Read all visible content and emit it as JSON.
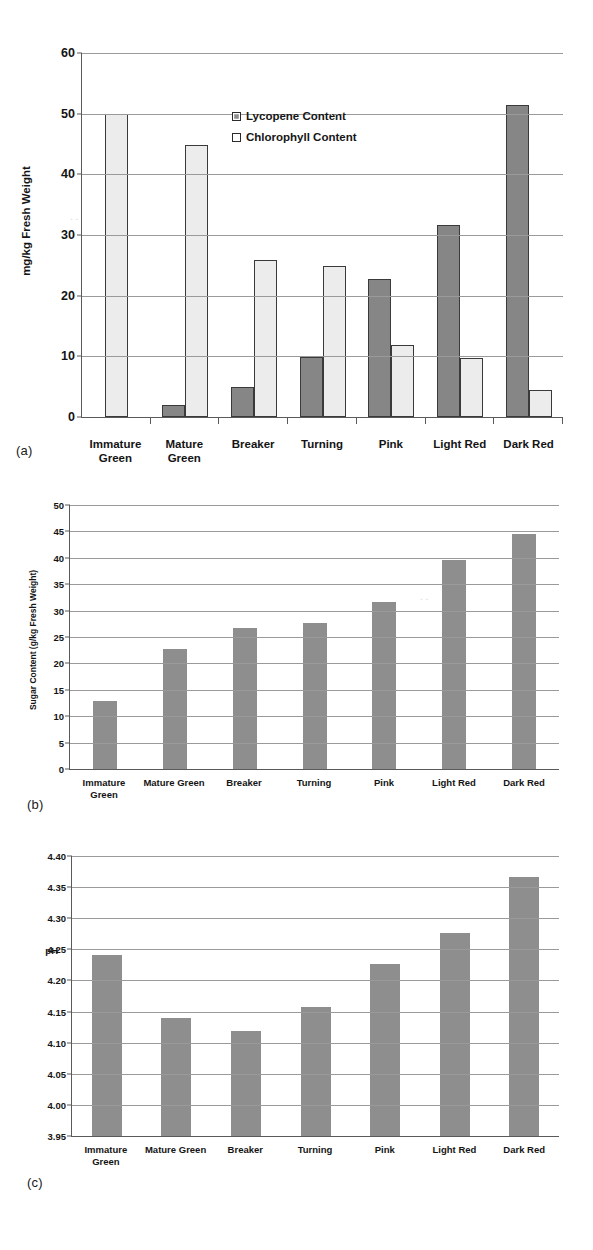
{
  "figure": {
    "panels": [
      {
        "tag": "(a)",
        "ylabel": "mg/kg Fresh Weight",
        "yticks": [
          "0",
          "10",
          "20",
          "30",
          "40",
          "50",
          "60"
        ]
      },
      {
        "tag": "(b)",
        "ylabel": "Sugar Content (g/kg Fresh Weight)",
        "yticks": [
          "0",
          "5",
          "10",
          "15",
          "20",
          "25",
          "30",
          "35",
          "40",
          "45",
          "50"
        ]
      },
      {
        "tag": "(c)",
        "ylabel": "pH",
        "yticks": [
          "3.95",
          "4.00",
          "4.05",
          "4.10",
          "4.15",
          "4.20",
          "4.25",
          "4.30",
          "4.35",
          "4.40"
        ]
      }
    ],
    "categories_a": [
      [
        "Immature",
        "Green"
      ],
      [
        "Mature",
        "Green"
      ],
      [
        "Breaker",
        ""
      ],
      [
        "Turning",
        ""
      ],
      [
        "Pink",
        ""
      ],
      [
        "Light Red",
        ""
      ],
      [
        "Dark Red",
        ""
      ]
    ],
    "categories_bc": [
      [
        "Immature",
        "Green"
      ],
      [
        "Mature Green",
        ""
      ],
      [
        "Breaker",
        ""
      ],
      [
        "Turning",
        ""
      ],
      [
        "Pink",
        ""
      ],
      [
        "Light Red",
        ""
      ],
      [
        "Dark Red",
        ""
      ]
    ],
    "legend": {
      "lycopene_label": "Lycopene Content",
      "chlorophyll_label": "Chlorophyll Content"
    },
    "colors": {
      "lycopene_fill": "#868686",
      "chlorophyll_fill": "#ececec",
      "single_bar_fill": "#8e8e8e",
      "axis": "#5a5a5a",
      "grid": "#9a9a9a",
      "text": "#141414"
    }
  },
  "chart_data": [
    {
      "id": "a",
      "type": "bar",
      "title": "",
      "panel_label": "(a)",
      "xlabel": "",
      "ylabel": "mg/kg Fresh Weight",
      "ylim": [
        0,
        60
      ],
      "ytick_values": [
        0,
        10,
        20,
        30,
        40,
        50,
        60
      ],
      "grid": true,
      "legend_position": "inside-top-center",
      "categories": [
        "Immature Green",
        "Mature Green",
        "Breaker",
        "Turning",
        "Pink",
        "Light Red",
        "Dark Red"
      ],
      "series": [
        {
          "name": "Lycopene Content",
          "values": [
            0,
            2.0,
            4.9,
            9.9,
            22.7,
            31.7,
            51.5
          ]
        },
        {
          "name": "Chlorophyll Content",
          "values": [
            50.0,
            44.8,
            25.8,
            24.9,
            11.9,
            9.7,
            4.5
          ]
        }
      ]
    },
    {
      "id": "b",
      "type": "bar",
      "title": "",
      "panel_label": "(b)",
      "xlabel": "",
      "ylabel": "Sugar Content (g/kg Fresh Weight)",
      "ylim": [
        0,
        50
      ],
      "ytick_values": [
        0,
        5,
        10,
        15,
        20,
        25,
        30,
        35,
        40,
        45,
        50
      ],
      "grid": true,
      "legend_position": "none",
      "categories": [
        "Immature Green",
        "Mature Green",
        "Breaker",
        "Turning",
        "Pink",
        "Light Red",
        "Dark Red"
      ],
      "series": [
        {
          "name": "Sugar Content",
          "values": [
            12.9,
            22.8,
            26.8,
            27.7,
            31.7,
            39.6,
            44.5
          ]
        }
      ]
    },
    {
      "id": "c",
      "type": "bar",
      "title": "",
      "panel_label": "(c)",
      "xlabel": "",
      "ylabel": "pH",
      "ylim": [
        3.95,
        4.4
      ],
      "ytick_values": [
        3.95,
        4.0,
        4.05,
        4.1,
        4.15,
        4.2,
        4.25,
        4.3,
        4.35,
        4.4
      ],
      "grid": true,
      "legend_position": "none",
      "categories": [
        "Immature Green",
        "Mature Green",
        "Breaker",
        "Turning",
        "Pink",
        "Light Red",
        "Dark Red"
      ],
      "series": [
        {
          "name": "pH",
          "values": [
            4.241,
            4.139,
            4.119,
            4.158,
            4.226,
            4.276,
            4.366
          ]
        }
      ]
    }
  ]
}
